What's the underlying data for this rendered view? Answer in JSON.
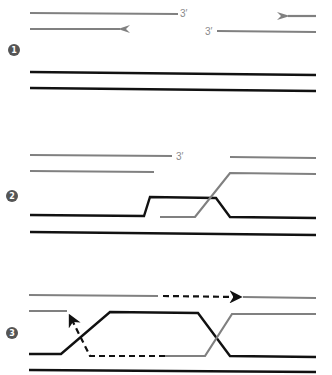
{
  "diagram": {
    "colors": {
      "template": "#111111",
      "invading": "#808080",
      "marker": "#555555"
    },
    "steps": [
      {
        "number": "1",
        "label_3prime_a": "3′",
        "label_3prime_b": "3′"
      },
      {
        "number": "2",
        "label_3prime_a": "3′"
      },
      {
        "number": "3"
      }
    ]
  }
}
